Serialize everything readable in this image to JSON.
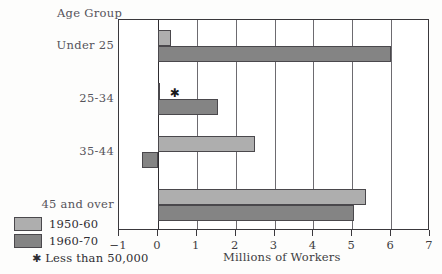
{
  "chart_data": {
    "type": "bar",
    "orientation": "horizontal",
    "title": "",
    "xlabel": "Millions of Workers",
    "ylabel": "Age Group",
    "categories": [
      "Under 25",
      "25-34",
      "35-44",
      "45 and over"
    ],
    "series": [
      {
        "name": "1950-60",
        "color": "#aeaeae",
        "values": [
          0.35,
          0.05,
          2.5,
          5.35
        ]
      },
      {
        "name": "1960-70",
        "color": "#848484",
        "values": [
          6.0,
          1.55,
          -0.4,
          5.05
        ]
      }
    ],
    "xlim": [
      -1,
      7
    ],
    "xticks": [
      -1,
      0,
      1,
      2,
      3,
      4,
      5,
      6,
      7
    ],
    "xtick_labels": [
      "−1",
      "0",
      "1",
      "2",
      "3",
      "4",
      "5",
      "6",
      "7"
    ],
    "grid": true,
    "grid_axis": "x",
    "legend_position": "bottom-left",
    "annotations": [
      {
        "marker": "✱",
        "text": "Less than 50,000",
        "applies_to": {
          "category": "25-34",
          "series": "1950-60"
        }
      }
    ]
  },
  "axes": {
    "y_title": "Age Group",
    "x_title": "Millions of Workers"
  },
  "legend": {
    "entries": [
      {
        "label": "1950-60",
        "color": "#aeaeae"
      },
      {
        "label": "1960-70",
        "color": "#848484"
      }
    ],
    "note_marker": "✱",
    "note_text": "Less than 50,000"
  }
}
